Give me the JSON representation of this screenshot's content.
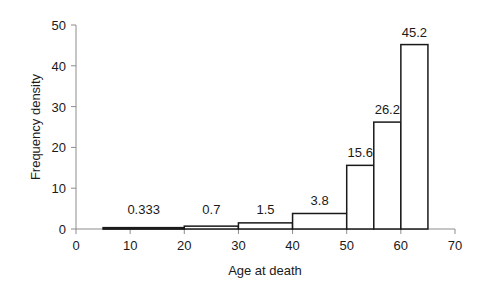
{
  "chart_data": {
    "type": "histogram",
    "title": "",
    "xlabel": "Age at death",
    "ylabel": "Frequency density",
    "xlim": [
      0,
      70
    ],
    "ylim": [
      0,
      50
    ],
    "x_ticks": [
      0,
      10,
      20,
      30,
      40,
      50,
      60,
      70
    ],
    "y_ticks": [
      0,
      10,
      20,
      30,
      40,
      50
    ],
    "grid": false,
    "legend": null,
    "bins": [
      {
        "start": 5,
        "end": 20,
        "value": 0.333,
        "label": "0.333"
      },
      {
        "start": 20,
        "end": 30,
        "value": 0.7,
        "label": "0.7"
      },
      {
        "start": 30,
        "end": 40,
        "value": 1.5,
        "label": "1.5"
      },
      {
        "start": 40,
        "end": 50,
        "value": 3.8,
        "label": "3.8"
      },
      {
        "start": 50,
        "end": 55,
        "value": 15.6,
        "label": "15.6"
      },
      {
        "start": 55,
        "end": 60,
        "value": 26.2,
        "label": "26.2"
      },
      {
        "start": 60,
        "end": 65,
        "value": 45.2,
        "label": "45.2"
      }
    ]
  },
  "style": {
    "bar_fill": "#ffffff",
    "bar_stroke": "#1a1a1a",
    "axis_color": "#8c8c8c"
  }
}
